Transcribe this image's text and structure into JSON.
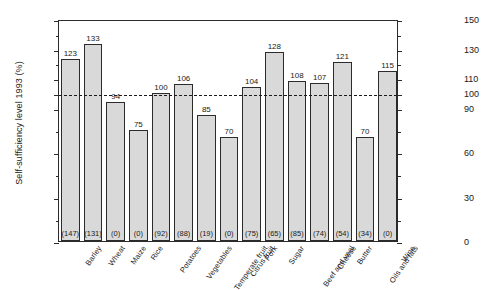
{
  "chart_data": {
    "type": "bar",
    "title": "",
    "subtitle": "",
    "xlabel": "",
    "ylabel": "Self-sufficiency level 1993 (%)",
    "ylim": [
      0,
      150
    ],
    "yticks": [
      0,
      30,
      60,
      90,
      100,
      110,
      130,
      150
    ],
    "ytick_labels": [
      "0",
      "30",
      "60",
      "90",
      "100",
      "110",
      "130",
      "150"
    ],
    "minor_yticks": [
      15,
      45,
      75,
      120,
      140
    ],
    "grid": false,
    "legend": "none",
    "reference_line": {
      "value": 100,
      "style": "dash-dot"
    },
    "right_axis": {
      "ticks": [
        0,
        30,
        60,
        90,
        100,
        110,
        130,
        150
      ],
      "labels": [
        "0",
        "30",
        "60",
        "90",
        "100",
        "110",
        "130",
        "150"
      ]
    },
    "categories": [
      "Barley",
      "Wheat",
      "Maize",
      "Rice",
      "Potatoes",
      "Vegetables",
      "Temperate fruit",
      "Citrus fruit",
      "Pork",
      "Sugar",
      "Beef and veal",
      "Cheese",
      "Butter",
      "Oils and fats",
      "Wine"
    ],
    "values": [
      123,
      133,
      94,
      75,
      100,
      106,
      85,
      70,
      104,
      128,
      108,
      107,
      121,
      70,
      115
    ],
    "value_labels": [
      "123",
      "133",
      "94",
      "75",
      "100",
      "106",
      "85",
      "70",
      "104",
      "128",
      "108",
      "107",
      "121",
      "70",
      "115"
    ],
    "secondary_labels": [
      "(147)",
      "(131)",
      "(0)",
      "(0)",
      "(92)",
      "(88)",
      "(19)",
      "(0)",
      "(75)",
      "(65)",
      "(85)",
      "(74)",
      "(54)",
      "(34)",
      "(0)"
    ],
    "bar_fill_color": "#d9d9d9",
    "bar_edge_color": "#2b2b2b",
    "axis_color": "#2b2b2b"
  }
}
